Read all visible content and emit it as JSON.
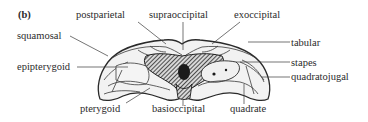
{
  "figure": {
    "panel_label": "(b)",
    "labels": {
      "postparietal": "postparietal",
      "supraoccipital": "supraoccipital",
      "exoccipital": "exoccipital",
      "squamosal": "squamosal",
      "tabular": "tabular",
      "epipterygoid": "epipterygoid",
      "stapes": "stapes",
      "quadratojugal": "quadratojugal",
      "pterygoid": "pterygoid",
      "basioccipital": "basioccipital",
      "quadrate": "quadrate"
    },
    "colors": {
      "ink": "#2b2b2b",
      "bone_fill": "#ececec",
      "shade": "#3a3a3a",
      "background": "#ffffff"
    }
  }
}
